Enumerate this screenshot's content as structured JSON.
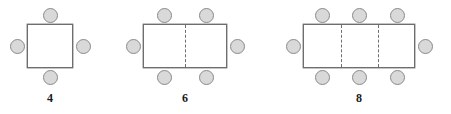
{
  "diagram": {
    "style": {
      "seat_fill": "#d9d9d9",
      "seat_stroke": "#8a8a8a",
      "table_fill": "#ffffff",
      "table_stroke": "#6e6e6e",
      "divider_stroke": "#6e6e6e",
      "label_color": "#1a1a1a",
      "background": "#ffffff"
    },
    "seat_diameter": 15,
    "figures": [
      {
        "id": "figure-1",
        "label": "4",
        "sections": 1,
        "seat_count": 4,
        "table": {
          "x": 27,
          "y": 24,
          "width": 46,
          "height": 44
        },
        "label_pos": {
          "x": 50,
          "y": 92
        },
        "dividers": [],
        "seats": [
          {
            "name": "seat-top-1",
            "x": 43,
            "y": 8
          },
          {
            "name": "seat-left-1",
            "x": 10,
            "y": 39
          },
          {
            "name": "seat-right-1",
            "x": 76,
            "y": 39
          },
          {
            "name": "seat-bottom-1",
            "x": 43,
            "y": 70
          }
        ]
      },
      {
        "id": "figure-2",
        "label": "6",
        "sections": 2,
        "seat_count": 6,
        "table": {
          "x": 143,
          "y": 24,
          "width": 84,
          "height": 44
        },
        "label_pos": {
          "x": 185,
          "y": 92
        },
        "dividers": [
          {
            "x": 185
          }
        ],
        "seats": [
          {
            "name": "seat-top-1",
            "x": 157,
            "y": 8
          },
          {
            "name": "seat-top-2",
            "x": 199,
            "y": 8
          },
          {
            "name": "seat-left-1",
            "x": 126,
            "y": 39
          },
          {
            "name": "seat-right-1",
            "x": 230,
            "y": 39
          },
          {
            "name": "seat-bottom-1",
            "x": 157,
            "y": 70
          },
          {
            "name": "seat-bottom-2",
            "x": 199,
            "y": 70
          }
        ]
      },
      {
        "id": "figure-3",
        "label": "8",
        "sections": 3,
        "seat_count": 8,
        "table": {
          "x": 303,
          "y": 24,
          "width": 112,
          "height": 44
        },
        "label_pos": {
          "x": 359,
          "y": 92
        },
        "dividers": [
          {
            "x": 341
          },
          {
            "x": 378
          }
        ],
        "seats": [
          {
            "name": "seat-top-1",
            "x": 315,
            "y": 8
          },
          {
            "name": "seat-top-2",
            "x": 352,
            "y": 8
          },
          {
            "name": "seat-top-3",
            "x": 390,
            "y": 8
          },
          {
            "name": "seat-left-1",
            "x": 286,
            "y": 39
          },
          {
            "name": "seat-right-1",
            "x": 418,
            "y": 39
          },
          {
            "name": "seat-bottom-1",
            "x": 315,
            "y": 70
          },
          {
            "name": "seat-bottom-2",
            "x": 352,
            "y": 70
          },
          {
            "name": "seat-bottom-3",
            "x": 390,
            "y": 70
          }
        ]
      }
    ]
  }
}
